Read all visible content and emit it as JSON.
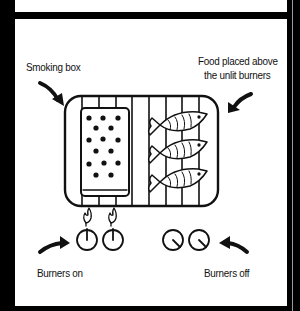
{
  "diagram": {
    "labels": {
      "smoking_box": "Smoking box",
      "food_line1": "Food placed above",
      "food_line2": "the unlit burners",
      "burners_on": "Burners on",
      "burners_off": "Burners off"
    },
    "grill": {
      "slat_count": 8,
      "fish_count": 3,
      "smoking_box_dots": 15
    },
    "burners": {
      "on": [
        {
          "id": 1,
          "state": "on",
          "flame": true
        },
        {
          "id": 2,
          "state": "on",
          "flame": true
        }
      ],
      "off": [
        {
          "id": 3,
          "state": "off",
          "flame": false
        },
        {
          "id": 4,
          "state": "off",
          "flame": false
        }
      ]
    },
    "colors": {
      "ink": "#111111",
      "frame": "#000000",
      "background": "#ffffff"
    }
  }
}
